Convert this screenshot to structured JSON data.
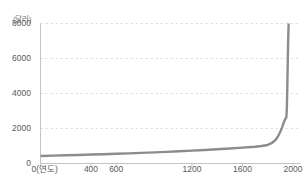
{
  "chart_data": {
    "type": "line",
    "title": "",
    "subtitle": "",
    "xlabel": "0(연도)",
    "ylabel": "(달러)",
    "unit_label": "(달러)",
    "legend": [],
    "legend_position": "none",
    "grid": true,
    "grid_style": "dashed-horizontal",
    "xlim": [
      0,
      2060
    ],
    "ylim": [
      0,
      8000
    ],
    "x_ticks": [
      {
        "value": 0,
        "label": "0(연도)"
      },
      {
        "value": 400,
        "label": "400"
      },
      {
        "value": 600,
        "label": "600"
      },
      {
        "value": 1200,
        "label": "1200"
      },
      {
        "value": 1600,
        "label": "1600"
      },
      {
        "value": 2000,
        "label": "2000"
      }
    ],
    "y_ticks": [
      {
        "value": 0,
        "label": "0"
      },
      {
        "value": 2000,
        "label": "2000"
      },
      {
        "value": 4000,
        "label": "4000"
      },
      {
        "value": 6000,
        "label": "6000"
      },
      {
        "value": 8000,
        "label": "8000"
      }
    ],
    "series": [
      {
        "name": "",
        "color": "#8c8c8c",
        "line_width": 2.4,
        "points": [
          [
            0,
            430
          ],
          [
            100,
            450
          ],
          [
            200,
            470
          ],
          [
            300,
            490
          ],
          [
            400,
            510
          ],
          [
            500,
            530
          ],
          [
            600,
            555
          ],
          [
            700,
            580
          ],
          [
            800,
            605
          ],
          [
            900,
            635
          ],
          [
            1000,
            665
          ],
          [
            1100,
            700
          ],
          [
            1200,
            735
          ],
          [
            1300,
            775
          ],
          [
            1400,
            815
          ],
          [
            1500,
            860
          ],
          [
            1600,
            905
          ],
          [
            1700,
            960
          ],
          [
            1750,
            1000
          ],
          [
            1800,
            1060
          ],
          [
            1830,
            1160
          ],
          [
            1860,
            1330
          ],
          [
            1880,
            1530
          ],
          [
            1900,
            1810
          ],
          [
            1915,
            2080
          ],
          [
            1925,
            2300
          ],
          [
            1935,
            2480
          ],
          [
            1942,
            2570
          ],
          [
            1948,
            2640
          ],
          [
            1952,
            3200
          ],
          [
            1955,
            4200
          ],
          [
            1958,
            5400
          ],
          [
            1961,
            6600
          ],
          [
            1964,
            7500
          ],
          [
            1966,
            8000
          ]
        ]
      }
    ]
  },
  "axes": {
    "y_axis_color": "#bdbdbd",
    "x_axis_color": "#bdbdbd",
    "grid_color": "#d8d8d8"
  }
}
